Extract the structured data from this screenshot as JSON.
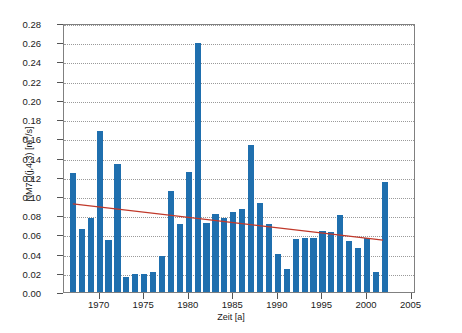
{
  "chart_data": {
    "type": "bar",
    "title": "",
    "xlabel": "Zeit [a]",
    "ylabel": "NM7Q(j,4,3) [m³/s]",
    "ylabel_main": "NM7Q(j,4,3) [m",
    "ylabel_sup": "3",
    "ylabel_tail": "/s]",
    "xlim": [
      1966,
      2005.5
    ],
    "ylim": [
      0.0,
      0.28
    ],
    "grid": true,
    "legend": false,
    "bar_color": "#1f6fae",
    "trend_color": "#c0392b",
    "axis_color": "#808080",
    "grid_color": "#9a9a9a",
    "ytick_labels": [
      "0.00",
      "0.02",
      "0.04",
      "0.06",
      "0.08",
      "0.10",
      "0.12",
      "0.14",
      "0.16",
      "0.18",
      "0.20",
      "0.22",
      "0.24",
      "0.26",
      "0.28"
    ],
    "ytick_values": [
      0.0,
      0.02,
      0.04,
      0.06,
      0.08,
      0.1,
      0.12,
      0.14,
      0.16,
      0.18,
      0.2,
      0.22,
      0.24,
      0.26,
      0.28
    ],
    "xtick_labels": [
      "1970",
      "1975",
      "1980",
      "1985",
      "1990",
      "1995",
      "2000",
      "2005"
    ],
    "xtick_values": [
      1970,
      1975,
      1980,
      1985,
      1990,
      1995,
      2000,
      2005
    ],
    "categories": [
      1967,
      1968,
      1969,
      1970,
      1971,
      1972,
      1973,
      1974,
      1975,
      1976,
      1977,
      1978,
      1979,
      1980,
      1981,
      1982,
      1983,
      1984,
      1985,
      1986,
      1987,
      1988,
      1989,
      1990,
      1991,
      1992,
      1993,
      1994,
      1995,
      1996,
      1997,
      1998,
      1999,
      2000,
      2001,
      2002
    ],
    "values": [
      0.124,
      0.066,
      0.077,
      0.168,
      0.054,
      0.133,
      0.016,
      0.019,
      0.019,
      0.021,
      0.038,
      0.105,
      0.071,
      0.125,
      0.259,
      0.072,
      0.081,
      0.077,
      0.083,
      0.086,
      0.153,
      0.093,
      0.071,
      0.04,
      0.024,
      0.055,
      0.056,
      0.056,
      0.064,
      0.062,
      0.08,
      0.053,
      0.046,
      0.056,
      0.021,
      0.114
    ],
    "series": [
      {
        "name": "NM7Q",
        "type": "bar",
        "values": [
          0.124,
          0.066,
          0.077,
          0.168,
          0.054,
          0.133,
          0.016,
          0.019,
          0.019,
          0.021,
          0.038,
          0.105,
          0.071,
          0.125,
          0.259,
          0.072,
          0.081,
          0.077,
          0.083,
          0.086,
          0.153,
          0.093,
          0.071,
          0.04,
          0.024,
          0.055,
          0.056,
          0.056,
          0.064,
          0.062,
          0.08,
          0.053,
          0.046,
          0.056,
          0.021,
          0.114
        ]
      },
      {
        "name": "Trendlinie",
        "type": "line",
        "x": [
          1967,
          2002
        ],
        "y": [
          0.0925,
          0.0545
        ]
      }
    ]
  }
}
